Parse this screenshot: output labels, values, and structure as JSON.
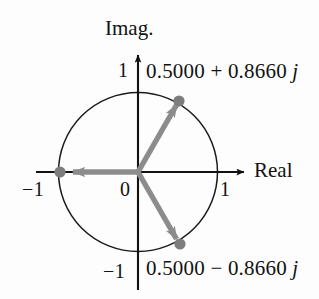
{
  "figure": {
    "axes": {
      "imag_label": "Imag.",
      "real_label": "Real"
    },
    "ticks": {
      "imag_positive": "1",
      "imag_negative": "−1",
      "real_positive": "1",
      "real_negative": "−1",
      "origin": "0"
    },
    "annotations": {
      "top": "0.5000 + 0.8660 j",
      "bottom": "0.5000 − 0.8660 j"
    },
    "colors": {
      "axis": "#111111",
      "circle": "#1a1a1a",
      "vector": "#8c8c8c",
      "point": "#7d7d7d",
      "background": "#fdfdfd",
      "text": "#121212"
    }
  },
  "chart_data": {
    "type": "scatter",
    "xlabel": "Real",
    "ylabel": "Imag.",
    "xlim": [
      -1.25,
      1.35
    ],
    "ylim": [
      -1.35,
      1.35
    ],
    "grid": false,
    "legend": null,
    "unit_circle": {
      "center": [
        0,
        0
      ],
      "radius": 1
    },
    "xticks": [
      -1,
      0,
      1
    ],
    "xticklabels": [
      "−1",
      "0",
      "1"
    ],
    "yticks": [
      -1,
      1
    ],
    "yticklabels": [
      "−1",
      "1"
    ],
    "points": [
      {
        "label": "0.5000 + 0.8660 j",
        "real": 0.5,
        "imag": 0.866,
        "magnitude": 1.0,
        "angle_deg": 60
      },
      {
        "label": "0.5000 − 0.8660 j",
        "real": 0.5,
        "imag": -0.866,
        "magnitude": 1.0,
        "angle_deg": -60
      },
      {
        "label": "−1",
        "real": -1.0,
        "imag": 0.0,
        "magnitude": 1.0,
        "angle_deg": 180
      }
    ],
    "vectors": [
      {
        "from": [
          0,
          0
        ],
        "to": [
          0.5,
          0.866
        ]
      },
      {
        "from": [
          0,
          0
        ],
        "to": [
          0.5,
          -0.866
        ]
      },
      {
        "from": [
          0,
          0
        ],
        "to": [
          -1.0,
          0.0
        ]
      }
    ],
    "annotations": [
      {
        "text": "0.5000 + 0.8660 j",
        "at": [
          0.5,
          0.866
        ],
        "placement": "upper-right"
      },
      {
        "text": "0.5000 − 0.8660 j",
        "at": [
          0.5,
          -0.866
        ],
        "placement": "lower-right"
      }
    ]
  }
}
